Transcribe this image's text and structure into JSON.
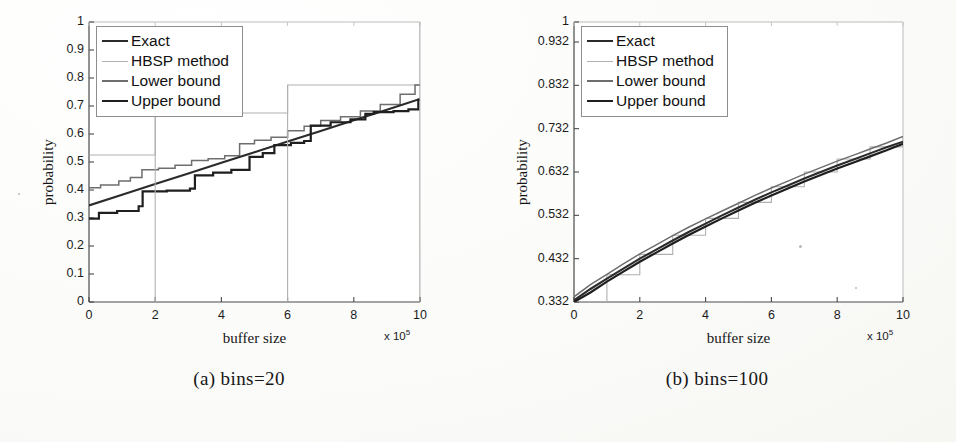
{
  "figure": {
    "background_color": "#fdfdfb",
    "ink_color": "#1a1a1a"
  },
  "series_styles": {
    "exact": {
      "name": "Exact",
      "color": "#2b2b2b",
      "width": 2.1
    },
    "hbsp": {
      "name": "HBSP method",
      "color": "#b0b0b0",
      "width": 1.1
    },
    "lower_bound": {
      "name": "Lower bound",
      "color": "#6e6e6e",
      "width": 1.5
    },
    "upper_bound": {
      "name": "Upper bound",
      "color": "#1f1f1f",
      "width": 2.2
    }
  },
  "subfigures": [
    {
      "id": "a",
      "caption": "(a) bins=20",
      "chart_data": {
        "type": "line",
        "title": "",
        "xlabel": "buffer size",
        "ylabel": "probability",
        "x_exponent": "x 10",
        "x_exponent_power": "5",
        "xlim": [
          0,
          10
        ],
        "ylim": [
          0,
          1
        ],
        "grid": false,
        "legend_position": "upper-left",
        "xticks": [
          0,
          2,
          4,
          6,
          8,
          10
        ],
        "xticklabels": [
          "0",
          "2",
          "4",
          "6",
          "8",
          "10"
        ],
        "yticks": [
          0,
          0.1,
          0.2,
          0.3,
          0.4,
          0.5,
          0.6,
          0.7,
          0.8,
          0.9,
          1
        ],
        "yticklabels": [
          "0",
          "0.1",
          "0.2",
          "0.3",
          "0.4",
          "0.5",
          "0.6",
          "0.7",
          "0.8",
          "0.9",
          "1"
        ],
        "legend": [
          "Exact",
          "HBSP method",
          "Lower bound",
          "Upper bound"
        ],
        "series": [
          {
            "name": "Exact",
            "key": "exact",
            "style": "line",
            "x": [
              0,
              1,
              2,
              3,
              4,
              5,
              6,
              7,
              8,
              9,
              10
            ],
            "values": [
              0.345,
              0.383,
              0.421,
              0.459,
              0.497,
              0.535,
              0.573,
              0.611,
              0.649,
              0.687,
              0.725
            ]
          },
          {
            "name": "HBSP method",
            "key": "hbsp",
            "style": "step",
            "x": [
              0,
              2,
              2,
              6,
              6,
              10,
              10
            ],
            "values": [
              0.525,
              0.525,
              0.675,
              0.675,
              0.775,
              0.775,
              1.0
            ]
          },
          {
            "name": "Lower bound",
            "key": "lower_bound",
            "style": "step",
            "x": [
              0.0,
              0.35,
              0.35,
              0.9,
              0.9,
              1.25,
              1.25,
              1.6,
              1.6,
              2.1,
              2.1,
              2.6,
              2.6,
              3.1,
              3.1,
              3.6,
              3.6,
              4.1,
              4.1,
              4.55,
              4.55,
              5.0,
              5.0,
              5.5,
              5.5,
              6.0,
              6.0,
              6.5,
              6.5,
              7.0,
              7.0,
              7.6,
              7.6,
              8.2,
              8.2,
              8.8,
              8.8,
              9.4,
              9.4,
              9.85,
              9.85,
              10.0
            ],
            "values": [
              0.408,
              0.408,
              0.418,
              0.418,
              0.432,
              0.432,
              0.445,
              0.445,
              0.472,
              0.472,
              0.478,
              0.478,
              0.488,
              0.488,
              0.505,
              0.505,
              0.512,
              0.512,
              0.522,
              0.522,
              0.565,
              0.565,
              0.578,
              0.578,
              0.588,
              0.588,
              0.612,
              0.612,
              0.628,
              0.628,
              0.648,
              0.648,
              0.662,
              0.662,
              0.682,
              0.682,
              0.705,
              0.705,
              0.742,
              0.742,
              0.775,
              0.775
            ]
          },
          {
            "name": "Upper bound",
            "key": "upper_bound",
            "style": "step",
            "x": [
              0.0,
              0.3,
              0.3,
              0.85,
              0.85,
              1.5,
              1.5,
              1.62,
              1.62,
              2.35,
              2.35,
              3.05,
              3.05,
              3.2,
              3.2,
              3.75,
              3.75,
              4.3,
              4.3,
              4.85,
              4.85,
              5.25,
              5.25,
              5.6,
              5.6,
              6.1,
              6.1,
              6.5,
              6.5,
              6.7,
              6.7,
              7.3,
              7.3,
              7.9,
              7.9,
              8.35,
              8.35,
              8.6,
              8.6,
              9.2,
              9.2,
              9.65,
              9.65,
              9.95,
              9.95,
              10.0
            ],
            "values": [
              0.298,
              0.298,
              0.318,
              0.318,
              0.325,
              0.325,
              0.342,
              0.342,
              0.395,
              0.395,
              0.398,
              0.398,
              0.405,
              0.405,
              0.452,
              0.452,
              0.462,
              0.462,
              0.472,
              0.472,
              0.518,
              0.518,
              0.532,
              0.532,
              0.56,
              0.56,
              0.568,
              0.568,
              0.575,
              0.575,
              0.63,
              0.63,
              0.642,
              0.642,
              0.652,
              0.652,
              0.672,
              0.672,
              0.678,
              0.678,
              0.682,
              0.682,
              0.688,
              0.688,
              0.722,
              0.722
            ]
          }
        ]
      }
    },
    {
      "id": "b",
      "caption": "(b) bins=100",
      "chart_data": {
        "type": "line",
        "title": "",
        "xlabel": "buffer size",
        "ylabel": "probability",
        "x_exponent": "x 10",
        "x_exponent_power": "5",
        "xlim": [
          0,
          10
        ],
        "ylim": [
          0.332,
          1
        ],
        "grid": false,
        "legend_position": "upper-left",
        "xticks": [
          0,
          2,
          4,
          6,
          8,
          10
        ],
        "xticklabels": [
          "0",
          "2",
          "4",
          "6",
          "8",
          "10"
        ],
        "yticks": [
          0.332,
          0.432,
          0.532,
          0.632,
          0.732,
          0.832,
          0.932,
          1
        ],
        "yticklabels": [
          "0.332",
          "0.432",
          "0.532",
          "0.632",
          "0.732",
          "0.832",
          "0.932",
          "1"
        ],
        "legend": [
          "Exact",
          "HBSP method",
          "Lower bound",
          "Upper bound"
        ],
        "series": [
          {
            "name": "Exact",
            "key": "exact",
            "style": "line",
            "x": [
              0,
              0.5,
              1,
              1.5,
              2,
              2.5,
              3,
              3.5,
              4,
              4.5,
              5,
              5.5,
              6,
              6.5,
              7,
              7.5,
              8,
              8.5,
              9,
              9.5,
              10
            ],
            "values": [
              0.336,
              0.362,
              0.386,
              0.409,
              0.432,
              0.453,
              0.474,
              0.494,
              0.513,
              0.532,
              0.55,
              0.568,
              0.585,
              0.601,
              0.617,
              0.632,
              0.647,
              0.661,
              0.675,
              0.689,
              0.702
            ]
          },
          {
            "name": "HBSP method",
            "key": "hbsp",
            "style": "step",
            "x": [
              0,
              1,
              1,
              2,
              2,
              3,
              3,
              4,
              4,
              5,
              5,
              6,
              6,
              7,
              7,
              8,
              8,
              9,
              9,
              10,
              10
            ],
            "values": [
              0.332,
              0.332,
              0.395,
              0.395,
              0.442,
              0.442,
              0.486,
              0.486,
              0.525,
              0.525,
              0.562,
              0.562,
              0.598,
              0.598,
              0.632,
              0.632,
              0.662,
              0.662,
              0.69,
              0.69,
              0.712
            ]
          },
          {
            "name": "Lower bound",
            "key": "lower_bound",
            "style": "step",
            "x": [
              0,
              0.5,
              1,
              1.5,
              2,
              2.5,
              3,
              3.5,
              4,
              4.5,
              5,
              5.5,
              6,
              6.5,
              7,
              7.5,
              8,
              8.5,
              9,
              9.5,
              10
            ],
            "values": [
              0.344,
              0.372,
              0.396,
              0.42,
              0.443,
              0.464,
              0.485,
              0.505,
              0.524,
              0.542,
              0.56,
              0.578,
              0.595,
              0.611,
              0.627,
              0.642,
              0.657,
              0.671,
              0.685,
              0.699,
              0.714
            ]
          },
          {
            "name": "Upper bound",
            "key": "upper_bound",
            "style": "step",
            "x": [
              0,
              0.5,
              1,
              1.5,
              2,
              2.5,
              3,
              3.5,
              4,
              4.5,
              5,
              5.5,
              6,
              6.5,
              7,
              7.5,
              8,
              8.5,
              9,
              9.5,
              10
            ],
            "values": [
              0.332,
              0.354,
              0.379,
              0.402,
              0.425,
              0.446,
              0.467,
              0.487,
              0.506,
              0.525,
              0.543,
              0.561,
              0.578,
              0.594,
              0.61,
              0.625,
              0.64,
              0.654,
              0.668,
              0.682,
              0.697
            ]
          }
        ]
      }
    }
  ]
}
